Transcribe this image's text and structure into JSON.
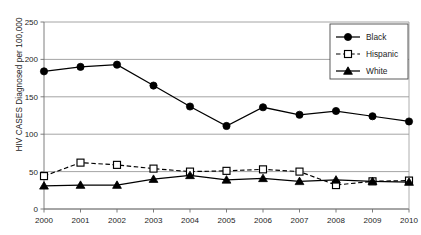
{
  "chart_data": {
    "type": "line",
    "title": "",
    "xlabel": "",
    "ylabel": "HIV CASES Diagnosed per 100,000",
    "categories": [
      "2000",
      "2001",
      "2002",
      "2003",
      "2004",
      "2005",
      "2006",
      "2007",
      "2008",
      "2009",
      "2010"
    ],
    "x": [
      2000,
      2001,
      2002,
      2003,
      2004,
      2005,
      2006,
      2007,
      2008,
      2009,
      2010
    ],
    "ylim": [
      0,
      250
    ],
    "yticks": [
      0,
      50,
      100,
      150,
      200,
      250
    ],
    "ytick_labels": [
      "0",
      "50",
      "100",
      "150",
      "200",
      "250"
    ],
    "grid": "horizontal",
    "legend_position": "top-right",
    "series": [
      {
        "name": "Black",
        "marker": "filled-circle",
        "line_style": "solid",
        "color": "#000000",
        "values": [
          184,
          190,
          193,
          165,
          137,
          111,
          136,
          126,
          131,
          124,
          117
        ]
      },
      {
        "name": "Hispanic",
        "marker": "open-square",
        "line_style": "dashed",
        "color": "#000000",
        "values": [
          44,
          62,
          59,
          54,
          50,
          51,
          53,
          50,
          32,
          37,
          38
        ]
      },
      {
        "name": "White",
        "marker": "filled-triangle",
        "line_style": "solid",
        "color": "#000000",
        "values": [
          31,
          32,
          32,
          40,
          45,
          39,
          41,
          37,
          39,
          37,
          36
        ]
      }
    ]
  },
  "legend": {
    "entries": [
      {
        "label": "Black"
      },
      {
        "label": "Hispanic"
      },
      {
        "label": "White"
      }
    ]
  }
}
